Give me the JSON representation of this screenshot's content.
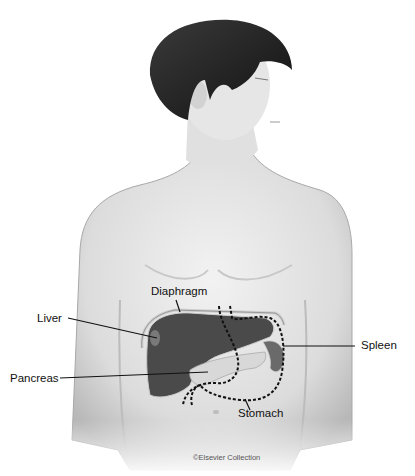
{
  "figure": {
    "labels": {
      "diaphragm": "Diaphragm",
      "liver": "Liver",
      "pancreas": "Pancreas",
      "spleen": "Spleen",
      "stomach": "Stomach"
    },
    "credit": "©Elsevier Collection"
  },
  "colors": {
    "background": "#ffffff",
    "skin": "#e2e2e2",
    "skin_shadow": "#bdbdbd",
    "hair": "#1e1e1e",
    "organ": "#4a4a4a",
    "pancreas": "#d8d8d8",
    "leader_line": "#111111"
  }
}
